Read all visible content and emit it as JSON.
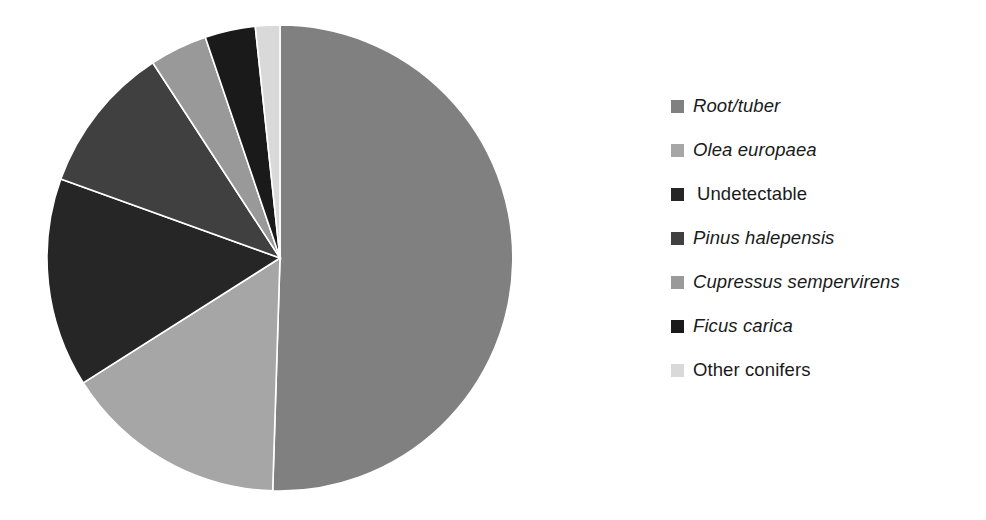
{
  "chart_data": {
    "type": "pie",
    "title": "",
    "subtitle": "",
    "xlabel": "",
    "ylabel": "",
    "legend_position": "right",
    "grid": false,
    "start_angle_deg": 0,
    "direction": "clockwise",
    "categories": [
      "Root/tuber",
      "Olea europaea",
      "Undetectable",
      "Pinus halepensis",
      "Cupressus sempervirens",
      "Ficus carica",
      "Other conifers"
    ],
    "values": [
      50.5,
      15.5,
      14.5,
      10.3,
      4.0,
      3.5,
      1.7
    ],
    "units": "percent",
    "slice_angles_deg": [
      181.8,
      55.8,
      52.2,
      37.1,
      14.4,
      12.6,
      6.1
    ],
    "colors": [
      "#808080",
      "#a6a6a6",
      "#262626",
      "#404040",
      "#999999",
      "#1a1a1a",
      "#d9d9d9"
    ]
  },
  "legend": {
    "items": [
      {
        "label": "Root/tuber",
        "color": "#808080",
        "style": "italic",
        "lead_space": false
      },
      {
        "label": "Olea europaea",
        "color": "#a6a6a6",
        "style": "italic",
        "lead_space": false
      },
      {
        "label": "Undetectable",
        "color": "#262626",
        "style": "roman",
        "lead_space": true
      },
      {
        "label": "Pinus halepensis",
        "color": "#404040",
        "style": "italic",
        "lead_space": false
      },
      {
        "label": "Cupressus sempervirens",
        "color": "#999999",
        "style": "italic",
        "lead_space": false
      },
      {
        "label": "Ficus carica",
        "color": "#1a1a1a",
        "style": "italic",
        "lead_space": false
      },
      {
        "label": "Other conifers",
        "color": "#d9d9d9",
        "style": "roman",
        "lead_space": false
      }
    ]
  },
  "pie_geometry": {
    "center_x": 280,
    "center_y": 258,
    "radius": 233
  },
  "canvas": {
    "width": 986,
    "height": 520,
    "background": "#ffffff"
  }
}
